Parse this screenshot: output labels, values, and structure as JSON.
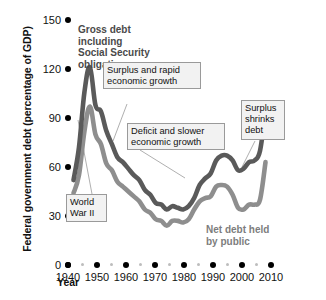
{
  "chart_data": {
    "type": "line",
    "title": "",
    "xlabel": "Year",
    "ylabel": "Federal government debt (percentage of GDP)",
    "xlim": [
      1938,
      2012
    ],
    "ylim": [
      0,
      150
    ],
    "grid": false,
    "legend": "inline-labels",
    "yticks": [
      0,
      30,
      60,
      90,
      120,
      150
    ],
    "ytick_labels": [
      "0",
      "30",
      "60",
      "90",
      "120",
      "150"
    ],
    "xticks": [
      1940,
      1950,
      1960,
      1970,
      1980,
      1990,
      2000,
      2010
    ],
    "xtick_labels": [
      "1940",
      "1950",
      "1960",
      "1970",
      "1980",
      "1990",
      "2000",
      "2010"
    ],
    "xminor_ticks": [
      1945,
      1955,
      1965,
      1975,
      1985,
      1995,
      2005
    ],
    "series": [
      {
        "name": "Gross debt including Social Security obligations",
        "color": "#5a5a5a",
        "x": [
          1940,
          1942,
          1944,
          1946,
          1948,
          1950,
          1952,
          1954,
          1956,
          1958,
          1960,
          1962,
          1964,
          1966,
          1968,
          1970,
          1972,
          1974,
          1976,
          1978,
          1980,
          1982,
          1984,
          1986,
          1988,
          1990,
          1992,
          1994,
          1996,
          1998,
          2000,
          2002,
          2004,
          2006,
          2008,
          2010
        ],
        "values": [
          52,
          72,
          106,
          121,
          98,
          94,
          82,
          74,
          66,
          63,
          59,
          55,
          52,
          46,
          43,
          38,
          37,
          34,
          36,
          35,
          34,
          36,
          41,
          49,
          53,
          56,
          64,
          67,
          67,
          64,
          58,
          59,
          63,
          64,
          70,
          94
        ]
      },
      {
        "name": "Net debt held by public",
        "color": "#8e8e8e",
        "x": [
          1940,
          1942,
          1944,
          1946,
          1948,
          1950,
          1952,
          1954,
          1956,
          1958,
          1960,
          1962,
          1964,
          1966,
          1968,
          1970,
          1972,
          1974,
          1976,
          1978,
          1980,
          1982,
          1984,
          1986,
          1988,
          1990,
          1992,
          1994,
          1996,
          1998,
          2000,
          2002,
          2004,
          2006,
          2008,
          2010
        ],
        "values": [
          44,
          55,
          82,
          97,
          80,
          74,
          62,
          58,
          51,
          48,
          45,
          42,
          39,
          34,
          32,
          28,
          27,
          24,
          27,
          27,
          26,
          28,
          34,
          39,
          41,
          42,
          48,
          49,
          48,
          43,
          35,
          34,
          37,
          37,
          40,
          63
        ]
      }
    ],
    "annotations": [
      {
        "name": "gross-debt-title",
        "text": "Gross debt\nincluding\nSocial Security\nobligations",
        "style": "bold-series-label",
        "series": "gross"
      },
      {
        "name": "net-debt-title",
        "text": "Net debt held\nby public",
        "style": "bold-series-label",
        "series": "net"
      },
      {
        "name": "world-war-ii-callout",
        "text": "World\nWar II",
        "style": "boxed-callout",
        "points_to_year": 1944
      },
      {
        "name": "surplus-rapid-growth-callout",
        "text": "Surplus and rapid\neconomic growth",
        "style": "boxed-callout",
        "points_to_year": 1955
      },
      {
        "name": "deficit-slower-growth-callout",
        "text": "Deficit and slower\neconomic growth",
        "style": "boxed-callout",
        "points_to_year": 1982
      },
      {
        "name": "surplus-shrinks-debt-callout",
        "text": "Surplus\nshrinks\ndebt",
        "style": "boxed-callout",
        "points_to_year": 2000
      }
    ]
  },
  "axis": {
    "y_title": "Federal government debt (percentage of GDP)",
    "x_title": "Year"
  }
}
